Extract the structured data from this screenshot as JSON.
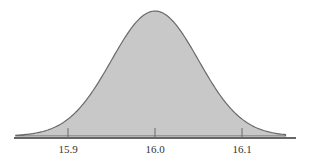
{
  "chart_data": {
    "type": "area",
    "title": "",
    "xlabel": "",
    "ylabel": "",
    "distribution": {
      "mean": 16.0,
      "sd": 0.05
    },
    "xlim": [
      15.84,
      16.15
    ],
    "x_ticks": [
      15.9,
      16.0,
      16.1
    ],
    "x_tick_labels": [
      "15.9",
      "16.0",
      "16.1"
    ],
    "grid": false,
    "legend": null
  },
  "colors": {
    "fill": "#c8c8c8",
    "stroke": "#6a6a6a",
    "axis": "#333333"
  }
}
